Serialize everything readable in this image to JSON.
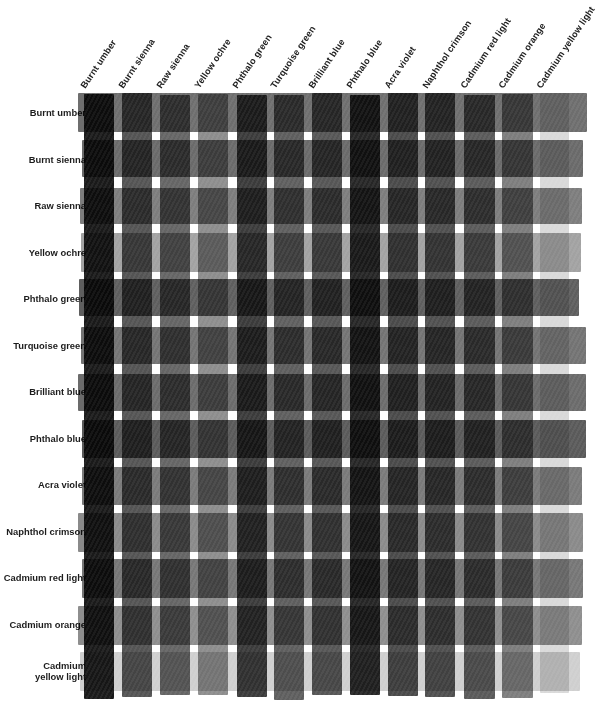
{
  "columns": [
    {
      "label": "Burnt umber",
      "gray": "#1a1a1a"
    },
    {
      "label": "Burnt sienna",
      "gray": "#545454"
    },
    {
      "label": "Raw sienna",
      "gray": "#656565"
    },
    {
      "label": "Yellow ochre",
      "gray": "#8d8d8d"
    },
    {
      "label": "Phthalo green",
      "gray": "#3b3b3b"
    },
    {
      "label": "Turquoise green",
      "gray": "#5e5e5e"
    },
    {
      "label": "Brilliant blue",
      "gray": "#565656"
    },
    {
      "label": "Phthalo blue",
      "gray": "#262626"
    },
    {
      "label": "Acra violet",
      "gray": "#4a4a4a"
    },
    {
      "label": "Naphthol crimson",
      "gray": "#4f4f4f"
    },
    {
      "label": "Cadmium red light",
      "gray": "#5a5a5a"
    },
    {
      "label": "Cadmium orange",
      "gray": "#7d7d7d"
    },
    {
      "label": "Cadmium yellow light",
      "gray": "#d9d9d9"
    }
  ],
  "rows": [
    {
      "label": "Burnt umber",
      "gray": "#6e6e6e"
    },
    {
      "label": "Burnt sienna",
      "gray": "#6a6a6a"
    },
    {
      "label": "Raw sienna",
      "gray": "#7d7d7d"
    },
    {
      "label": "Yellow ochre",
      "gray": "#a2a2a2"
    },
    {
      "label": "Phthalo green",
      "gray": "#5e5e5e"
    },
    {
      "label": "Turquoise green",
      "gray": "#737373"
    },
    {
      "label": "Brilliant blue",
      "gray": "#6b6b6b"
    },
    {
      "label": "Phthalo blue",
      "gray": "#5a5a5a"
    },
    {
      "label": "Acra violet",
      "gray": "#7a7a7a"
    },
    {
      "label": "Naphthol crimson",
      "gray": "#8a8a8a"
    },
    {
      "label": "Cadmium red light",
      "gray": "#767676"
    },
    {
      "label": "Cadmium orange",
      "gray": "#8e8e8e"
    },
    {
      "label": "Cadmium\nyellow light",
      "gray": "#cfcfcf"
    }
  ],
  "chart_data": {
    "type": "heatmap",
    "xlabel": "",
    "ylabel": "",
    "grid": false,
    "legend": "none",
    "note": "Grayscale reproduction of a watercolour mixing chart: 13 vertical paint strips overlaid on 13 horizontal paint strips; each intersection shows the mixed (multiplied) value.",
    "categories_x": [
      "Burnt umber",
      "Burnt sienna",
      "Raw sienna",
      "Yellow ochre",
      "Phthalo green",
      "Turquoise green",
      "Brilliant blue",
      "Phthalo blue",
      "Acra violet",
      "Naphthol crimson",
      "Cadmium red light",
      "Cadmium orange",
      "Cadmium yellow light"
    ],
    "categories_y": [
      "Burnt umber",
      "Burnt sienna",
      "Raw sienna",
      "Yellow ochre",
      "Phthalo green",
      "Turquoise green",
      "Brilliant blue",
      "Phthalo blue",
      "Acra violet",
      "Naphthol crimson",
      "Cadmium red light",
      "Cadmium orange",
      "Cadmium yellow light"
    ],
    "column_values": [
      26,
      84,
      101,
      141,
      59,
      94,
      86,
      38,
      74,
      79,
      90,
      125,
      217
    ],
    "row_values": [
      110,
      106,
      125,
      162,
      94,
      115,
      107,
      90,
      122,
      138,
      118,
      142,
      207
    ],
    "value_scale": "0 = black, 255 = white (8-bit gray level of each pure paint strip)",
    "values": [
      [
        11,
        36,
        44,
        61,
        25,
        41,
        37,
        16,
        32,
        34,
        39,
        54,
        94
      ],
      [
        11,
        35,
        42,
        59,
        24,
        39,
        36,
        16,
        31,
        33,
        37,
        52,
        90
      ],
      [
        13,
        41,
        50,
        70,
        29,
        46,
        42,
        19,
        36,
        39,
        44,
        62,
        107
      ],
      [
        17,
        53,
        64,
        90,
        38,
        60,
        55,
        24,
        47,
        50,
        57,
        80,
        138
      ],
      [
        10,
        31,
        37,
        52,
        22,
        35,
        32,
        14,
        27,
        29,
        33,
        46,
        80
      ],
      [
        12,
        38,
        46,
        64,
        27,
        42,
        39,
        17,
        33,
        36,
        40,
        56,
        98
      ],
      [
        11,
        35,
        42,
        59,
        25,
        40,
        36,
        16,
        31,
        33,
        38,
        52,
        91
      ],
      [
        9,
        30,
        36,
        50,
        21,
        33,
        30,
        13,
        26,
        28,
        32,
        44,
        77
      ],
      [
        12,
        40,
        48,
        67,
        28,
        45,
        41,
        18,
        35,
        38,
        43,
        60,
        104
      ],
      [
        14,
        45,
        55,
        76,
        32,
        51,
        47,
        21,
        40,
        43,
        49,
        68,
        118
      ],
      [
        12,
        39,
        47,
        65,
        27,
        43,
        40,
        18,
        34,
        37,
        42,
        58,
        100
      ],
      [
        14,
        47,
        56,
        79,
        33,
        52,
        48,
        21,
        41,
        44,
        50,
        70,
        121
      ],
      [
        21,
        68,
        82,
        114,
        48,
        76,
        70,
        31,
        60,
        64,
        73,
        101,
        176
      ]
    ]
  },
  "layout": {
    "plot_left": 84,
    "plot_top": 92,
    "plot_width": 512,
    "plot_height": 627,
    "col_pitch": 38.0,
    "col_strip_width": 30.0,
    "row_pitch": 46.5,
    "row_strip_height": 38.0,
    "label_angle_deg": -56
  }
}
